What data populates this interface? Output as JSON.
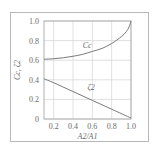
{
  "chart_data": {
    "type": "line",
    "title": "",
    "xlabel": "A2/A1",
    "ylabel": "Cc, ζ2",
    "xlim": [
      0.1,
      1.0
    ],
    "ylim": [
      0,
      1.0
    ],
    "grid": true,
    "x_ticks": [
      0.2,
      0.4,
      0.6,
      0.8,
      1.0
    ],
    "x_tick_labels": [
      "0.2",
      "0.4",
      "0.6",
      "0.8",
      "1.0"
    ],
    "y_ticks": [
      0,
      0.2,
      0.4,
      0.6,
      0.8,
      1.0
    ],
    "y_tick_labels": [
      "0",
      "0.2",
      "0.4",
      "0.6",
      "0.8",
      "1.0"
    ],
    "series": [
      {
        "name": "Cc",
        "label": "Cc",
        "x": [
          0.1,
          0.2,
          0.3,
          0.4,
          0.5,
          0.6,
          0.7,
          0.8,
          0.9,
          0.95,
          0.98,
          1.0
        ],
        "y": [
          0.61,
          0.615,
          0.625,
          0.64,
          0.66,
          0.69,
          0.72,
          0.77,
          0.84,
          0.89,
          0.94,
          1.0
        ]
      },
      {
        "name": "ζ2",
        "label": "ζ2",
        "x": [
          0.1,
          0.2,
          0.4,
          0.6,
          0.8,
          1.0
        ],
        "y": [
          0.41,
          0.37,
          0.28,
          0.19,
          0.1,
          0.01
        ]
      }
    ]
  }
}
